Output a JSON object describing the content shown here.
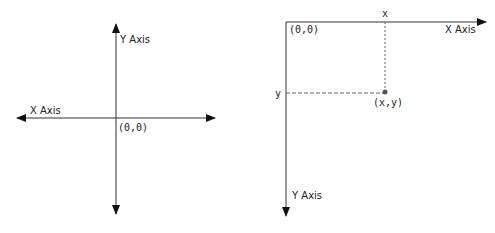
{
  "diagrams": [
    {
      "name": "cartesian-coordinate-system",
      "labels": {
        "y_axis": "Y Axis",
        "x_axis": "X Axis",
        "origin": "(0,0)"
      }
    },
    {
      "name": "screen-coordinate-system",
      "labels": {
        "x_axis": "X Axis",
        "y_axis": "Y Axis",
        "origin": "(0,0)",
        "x_tick": "x",
        "y_tick": "y",
        "point": "(x,y)"
      }
    }
  ],
  "colors": {
    "line": "#333333",
    "dashed": "#666666",
    "point": "#555555"
  }
}
